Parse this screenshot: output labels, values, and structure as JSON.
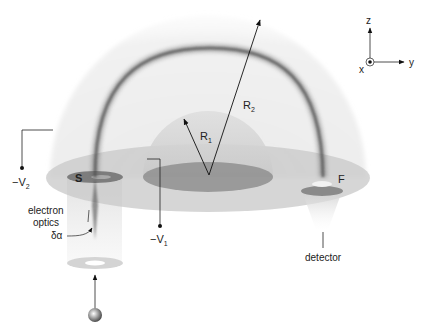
{
  "figure": {
    "type": "hemispherical electron energy analyzer schematic",
    "colors": {
      "outer_hemisphere": "#e6e6e6",
      "inner_hemisphere": "#d2d2d2",
      "base_disk": "#c8c8c8",
      "inner_disk": "#8e8e8e",
      "trajectory": "#5a5a5a",
      "lines": "#222222"
    }
  },
  "labels": {
    "outer_radius": "R",
    "outer_radius_sub": "2",
    "inner_radius": "R",
    "inner_radius_sub": "1",
    "outer_voltage": "−V",
    "outer_voltage_sub": "2",
    "inner_voltage": "−V",
    "inner_voltage_sub": "1",
    "source_slit": "S",
    "focus_point": "F",
    "electron_optics_line1": "electron",
    "electron_optics_line2": "optics",
    "acceptance_angle": "δα",
    "detector": "detector"
  },
  "axes": {
    "z": "z",
    "y": "y",
    "x": "x"
  }
}
